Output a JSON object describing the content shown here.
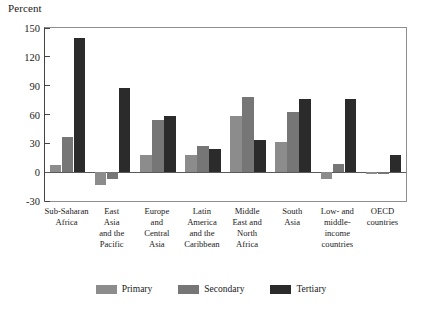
{
  "chart_data": {
    "type": "bar",
    "title": "",
    "subtitle": "",
    "xlabel": "",
    "ylabel": "Percent",
    "ylim": [
      -30,
      150
    ],
    "yticks": [
      150,
      120,
      90,
      60,
      30,
      0,
      -30
    ],
    "grid": false,
    "legend_position": "bottom",
    "orientation": "vertical",
    "grouping": "grouped",
    "categories": [
      "Sub-Saharan\nAfrica",
      "East\nAsia\nand the\nPacific",
      "Europe\nand\nCentral\nAsia",
      "Latin\nAmerica\nand the\nCaribbean",
      "Middle\nEast and\nNorth\nAfrica",
      "South\nAsia",
      "Low- and\nmiddle-\nincome\ncountries",
      "OECD\ncountries"
    ],
    "series": [
      {
        "name": "Primary",
        "color": "#8c8c8c",
        "values": [
          7,
          -13,
          18,
          18,
          58,
          31,
          -7,
          -2
        ]
      },
      {
        "name": "Secondary",
        "color": "#767676",
        "values": [
          37,
          -7,
          54,
          27,
          78,
          63,
          9,
          -2
        ]
      },
      {
        "name": "Tertiary",
        "color": "#2b2b2b",
        "values": [
          140,
          88,
          58,
          24,
          33,
          76,
          76,
          18
        ]
      }
    ]
  },
  "axis": {
    "y_title": "Percent"
  },
  "colors": {
    "primary": "#8c8c8c",
    "secondary": "#767676",
    "tertiary": "#2b2b2b",
    "frame": "#8e8e8e",
    "axis": "#444444",
    "background": "#ffffff",
    "text": "#1a1a1a"
  }
}
